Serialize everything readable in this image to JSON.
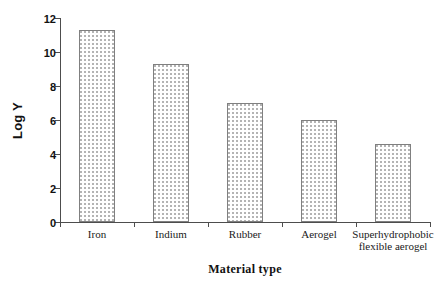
{
  "chart_data": {
    "type": "bar",
    "title": "",
    "subtitle": "",
    "xlabel": "Material type",
    "ylabel": "Log Y",
    "categories": [
      "Iron",
      "Indium",
      "Rubber",
      "Aerogel",
      "Superhydrophobic flexible aerogel"
    ],
    "category_label_lines": [
      [
        "Iron"
      ],
      [
        "Indium"
      ],
      [
        "Rubber"
      ],
      [
        "Aerogel"
      ],
      [
        "Superhydrophobic",
        "flexible aerogel"
      ]
    ],
    "values": [
      11.3,
      9.3,
      7.0,
      6.0,
      4.6
    ],
    "ylim": [
      0,
      12
    ],
    "ytick_labels": [
      "0",
      "2",
      "4",
      "6",
      "8",
      "10",
      "12"
    ],
    "ytick_values": [
      0,
      2,
      4,
      6,
      8,
      10,
      12
    ],
    "grid": false,
    "legend": false,
    "legend_position": "none",
    "bar_fill": "dotted-stipple",
    "bar_fill_color": "#ffffff",
    "bar_dot_color": "#b4b4b4",
    "bar_edge_color": "#808080",
    "axis_color": "#4d4d4d",
    "background_color": "#ffffff"
  }
}
